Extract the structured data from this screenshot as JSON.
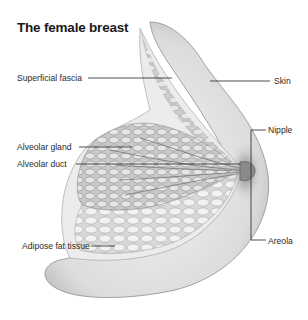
{
  "title": "The female breast",
  "labels": {
    "left": [
      {
        "id": "superficial-fascia",
        "text": "Superficial fascia"
      },
      {
        "id": "alveolar-gland",
        "text": "Alveolar gland"
      },
      {
        "id": "alveolar-duct",
        "text": "Alveolar duct"
      },
      {
        "id": "adipose-fat-tissue",
        "text": "Adipose fat tissue"
      }
    ],
    "right": [
      {
        "id": "skin",
        "text": "Skin"
      },
      {
        "id": "nipple",
        "text": "Nipple"
      },
      {
        "id": "areola",
        "text": "Areola"
      }
    ]
  },
  "colors": {
    "background": "#ffffff",
    "ink": "#222222",
    "skin_tone": "#e3e3e3",
    "tissue": "#bdbdbd"
  }
}
